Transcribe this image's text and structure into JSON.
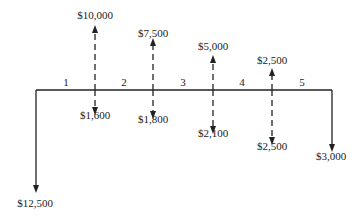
{
  "diagram": {
    "type": "cash-flow-diagram",
    "periods": [
      "1",
      "2",
      "3",
      "4",
      "5"
    ],
    "initial_outflow": {
      "label": "$12,500",
      "value": -12500,
      "time": 0
    },
    "final_outflow": {
      "label": "$3,000",
      "value": -3000,
      "time": 5
    },
    "flows": [
      {
        "time": 1,
        "inflow": {
          "label": "$10,000",
          "value": 10000
        },
        "outflow": {
          "label": "$1,600",
          "value": -1600
        }
      },
      {
        "time": 2,
        "inflow": {
          "label": "$7,500",
          "value": 7500
        },
        "outflow": {
          "label": "$1,800",
          "value": -1800
        }
      },
      {
        "time": 3,
        "inflow": {
          "label": "$5,000",
          "value": 5000
        },
        "outflow": {
          "label": "$2,100",
          "value": -2100
        }
      },
      {
        "time": 4,
        "inflow": {
          "label": "$2,500",
          "value": 2500
        },
        "outflow": {
          "label": "$2,500",
          "value": -2500
        }
      }
    ],
    "colors": {
      "line": "#222222",
      "background": "#ffffff"
    }
  }
}
